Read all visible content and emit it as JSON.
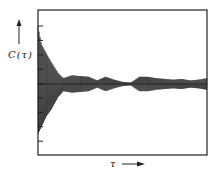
{
  "chart_data": {
    "type": "line",
    "title": "",
    "xlabel": "τ",
    "ylabel": "C(τ)",
    "x_tick_labels": [],
    "y_tick_labels": [],
    "y_ticks_count": 9,
    "grid": false,
    "legend": null,
    "ylim": [
      -1,
      1
    ],
    "xlim": [
      0,
      1
    ],
    "envelope": {
      "x": [
        0.0,
        0.02,
        0.05,
        0.08,
        0.12,
        0.15,
        0.2,
        0.3,
        0.35,
        0.4,
        0.45,
        0.5,
        0.55,
        0.6,
        0.65,
        0.7,
        0.75,
        0.8,
        0.85,
        0.9,
        0.95,
        1.0
      ],
      "upper": [
        0.8,
        0.55,
        0.42,
        0.3,
        0.15,
        0.08,
        0.12,
        0.1,
        0.05,
        0.1,
        0.06,
        0.03,
        0.02,
        0.1,
        0.1,
        0.08,
        0.07,
        0.06,
        0.07,
        0.05,
        0.06,
        0.08
      ],
      "lower": [
        -0.7,
        -0.6,
        -0.45,
        -0.35,
        -0.18,
        -0.1,
        -0.12,
        -0.1,
        -0.05,
        -0.1,
        -0.06,
        -0.03,
        -0.02,
        -0.1,
        -0.1,
        -0.08,
        -0.07,
        -0.06,
        -0.07,
        -0.05,
        -0.06,
        -0.08
      ]
    }
  },
  "labels": {
    "y_axis": "C(τ)",
    "x_axis": "τ"
  },
  "style": {
    "line_color": "#1a1a1a",
    "frame_color": "#222222"
  }
}
